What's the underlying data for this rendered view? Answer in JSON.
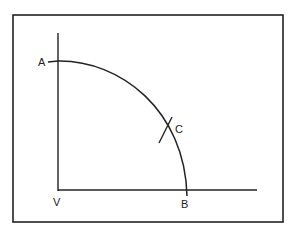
{
  "diagram": {
    "type": "geometric-construction",
    "labels": {
      "a": "A",
      "b": "B",
      "c": "C",
      "v": "V"
    },
    "colors": {
      "stroke": "#222222",
      "background": "#ffffff"
    }
  }
}
